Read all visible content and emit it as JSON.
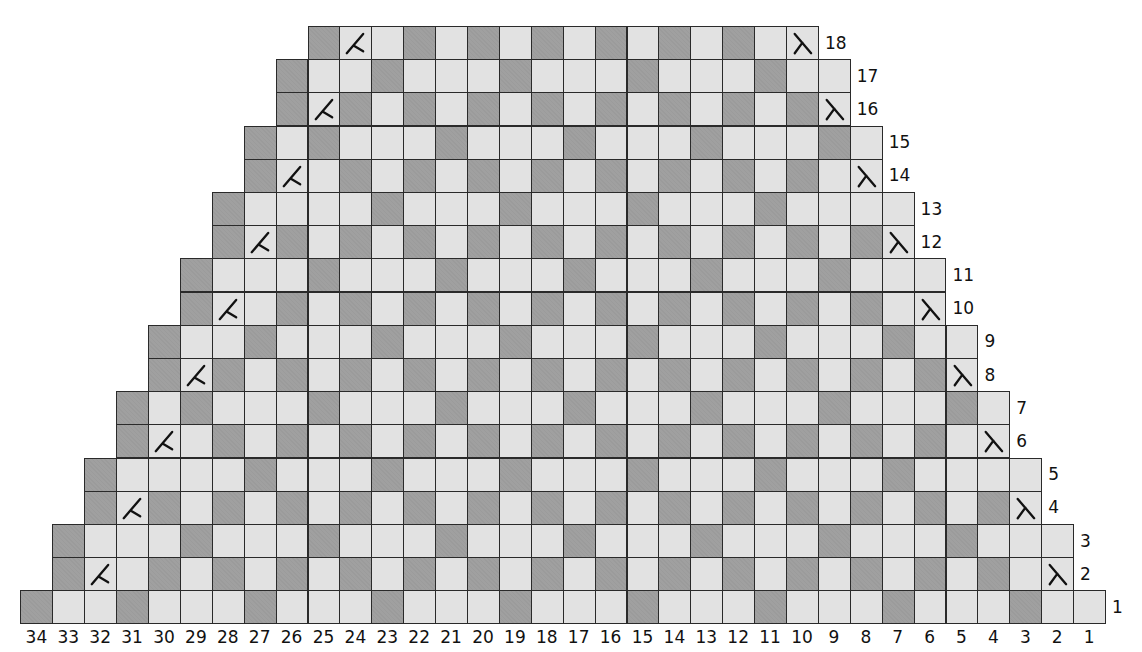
{
  "colors": {
    "dark_cell": "#a0a0a0",
    "light_cell": "#e2e2e2",
    "grid_line": "#2a2a2a",
    "text": "#111111"
  },
  "legend_codes": {
    "D": "dark (contrast color) stitch",
    "L": "light (main color) stitch",
    "K": "left-slanting decrease symbol on light square",
    "S": "right-slanting decrease symbol on light square"
  },
  "chart_data": {
    "type": "table",
    "title": "",
    "num_columns": 34,
    "num_rows": 18,
    "column_labels": [
      "34",
      "33",
      "32",
      "31",
      "30",
      "29",
      "28",
      "27",
      "26",
      "25",
      "24",
      "23",
      "22",
      "21",
      "20",
      "19",
      "18",
      "17",
      "16",
      "15",
      "14",
      "13",
      "12",
      "11",
      "10",
      "9",
      "8",
      "7",
      "6",
      "5",
      "4",
      "3",
      "2",
      "1"
    ],
    "rows": [
      {
        "label": "1",
        "from_col": 34,
        "to_col": 1,
        "cells": "DLLDLLLDLLLDLLLDLLLDLLLDLLLDLLLDLL"
      },
      {
        "label": "2",
        "from_col": 33,
        "to_col": 2,
        "cells": "DKLDLDLDLDLDLDLDLDLDLDLDLDLDLDLS"
      },
      {
        "label": "3",
        "from_col": 33,
        "to_col": 2,
        "cells": "DLLLDLLLDLLLDLLLDLLLDLLLDLLLDLLL"
      },
      {
        "label": "4",
        "from_col": 32,
        "to_col": 3,
        "cells": "DKDLDLDLDLDLDLDLDLDLDLDLDLDLDS"
      },
      {
        "label": "5",
        "from_col": 32,
        "to_col": 3,
        "cells": "DLLLLDLLLDLLLDLLLDLLLDLLLDLLLL"
      },
      {
        "label": "6",
        "from_col": 31,
        "to_col": 4,
        "cells": "DKLDLDLDLDLDLDLDLDLDLDLDLDLS"
      },
      {
        "label": "7",
        "from_col": 31,
        "to_col": 4,
        "cells": "DLDLLLDLLLDLLLDLLLDLLLDLLLDL"
      },
      {
        "label": "8",
        "from_col": 30,
        "to_col": 5,
        "cells": "DKDLDLDLDLDLDLDLDLDLDLDLDS"
      },
      {
        "label": "9",
        "from_col": 30,
        "to_col": 5,
        "cells": "DLLDLLLDLLLDLLLDLLLDLLLDLL"
      },
      {
        "label": "10",
        "from_col": 29,
        "to_col": 6,
        "cells": "DKLDLDLDLDLDLDLDLDLDLDLS"
      },
      {
        "label": "11",
        "from_col": 29,
        "to_col": 6,
        "cells": "DLLLDLLLDLLLDLLLDLLLDLLL"
      },
      {
        "label": "12",
        "from_col": 28,
        "to_col": 7,
        "cells": "DKDLDLDLDLDLDLDLDLDLDS"
      },
      {
        "label": "13",
        "from_col": 28,
        "to_col": 7,
        "cells": "DLLLLDLLLDLLLDLLLDLLLL"
      },
      {
        "label": "14",
        "from_col": 27,
        "to_col": 8,
        "cells": "DKLDLDLDLDLDLDLDLDLS"
      },
      {
        "label": "15",
        "from_col": 27,
        "to_col": 8,
        "cells": "DLDLLLDLLLDLLLDLLLDL"
      },
      {
        "label": "16",
        "from_col": 26,
        "to_col": 9,
        "cells": "DKDLDLDLDLDLDLDLDS"
      },
      {
        "label": "17",
        "from_col": 26,
        "to_col": 9,
        "cells": "DLLDLLLDLLLDLLLDLL"
      },
      {
        "label": "18",
        "from_col": 25,
        "to_col": 10,
        "cells": "DKLDLDLDLDLDLDLS"
      }
    ]
  }
}
